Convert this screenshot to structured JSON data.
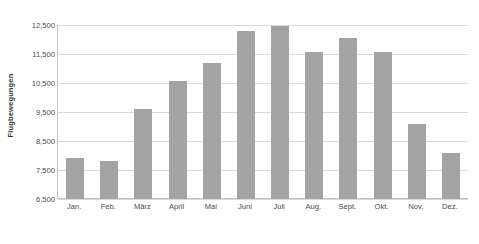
{
  "chart_data": {
    "type": "bar",
    "title": "",
    "subtitle": "",
    "xlabel": "",
    "ylabel": "Flugbewegungen",
    "categories": [
      "Jan.",
      "Feb.",
      "März",
      "April",
      "Mai",
      "Juni",
      "Juli",
      "Aug.",
      "Sept.",
      "Okt.",
      "Nov.",
      "Dez."
    ],
    "values": [
      7900,
      7800,
      9600,
      10570,
      11190,
      12290,
      12450,
      11570,
      12060,
      11560,
      9100,
      8090
    ],
    "series": [
      {
        "name": "Flugbewegungen",
        "values": [
          7900,
          7800,
          9600,
          10570,
          11190,
          12290,
          12450,
          11570,
          12060,
          11560,
          9100,
          8090
        ]
      }
    ],
    "ylim": [
      6500,
      12500
    ],
    "ytick_values": [
      6500,
      7500,
      8500,
      9500,
      10500,
      11500,
      12500
    ],
    "ytick_labels": [
      "6,500",
      "7,500",
      "8,500",
      "9,500",
      "10,500",
      "11,500",
      "12,500"
    ],
    "grid": true,
    "grid_axis": "y",
    "legend": false,
    "legend_position": "none",
    "bar_color": "#a3a3a3",
    "gridline_color": "#d9d9d9",
    "axis_color": "#bfbfbf",
    "text_color": "#4a4a4a"
  },
  "caption": {
    "text": ""
  }
}
